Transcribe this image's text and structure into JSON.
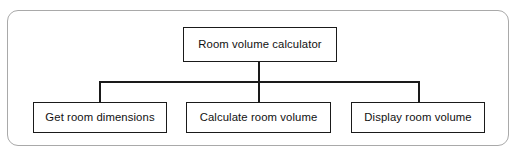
{
  "diagram": {
    "type": "hierarchy-structure-chart",
    "frame": {
      "name": "outer-frame",
      "border_color": "#a9a9a9",
      "background": "#ffffff",
      "corner_radius": "11px"
    },
    "node_style": {
      "border_color": "#1a1a1a",
      "background": "#ffffff",
      "text_color": "#111111"
    },
    "root": {
      "id": "root",
      "label": "Room volume calculator"
    },
    "children": [
      {
        "id": "child-0",
        "label": "Get room dimensions"
      },
      {
        "id": "child-1",
        "label": "Calculate room volume"
      },
      {
        "id": "child-2",
        "label": "Display room volume"
      }
    ],
    "connectors": {
      "style": "orthogonal-bracket",
      "color": "#1a1a1a",
      "count": 3
    }
  }
}
